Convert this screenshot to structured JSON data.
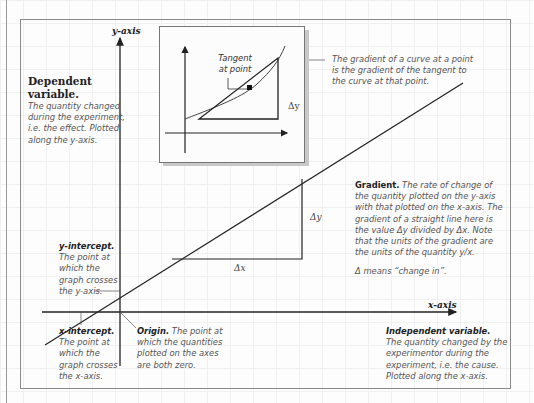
{
  "axes": {
    "y_label": "y-axis",
    "x_label": "x-axis"
  },
  "dependent_variable": {
    "title": "Dependent variable.",
    "lines": [
      "The quantity changed",
      "during the experiment,",
      "i.e. the effect. Plotted",
      "along the y-axis."
    ]
  },
  "inset": {
    "tangent_label_lines": [
      "Tangent",
      "at point"
    ],
    "delta_y": "Δy",
    "caption_lines": [
      "The gradient of a curve at a point",
      "is the gradient of the tangent to",
      "the curve at that point."
    ]
  },
  "gradient": {
    "title": "Gradient.",
    "first_line_rest": " The rate of change of",
    "lines": [
      "the quantity plotted on the y-axis",
      "with that plotted on the x-axis. The",
      "gradient of a straight line here is",
      "the value Δy divided by Δx. Note",
      "that the units of the gradient are",
      "the units of the quantity y/x."
    ],
    "note": "Δ means “change in”.",
    "delta_x": "Δx",
    "delta_y": "Δy"
  },
  "y_intercept": {
    "title": "y-intercept.",
    "lines": [
      "The point at",
      "which the",
      "graph crosses",
      "the y-axis."
    ]
  },
  "x_intercept": {
    "title": "x-intercept.",
    "lines": [
      "The point at",
      "which the",
      "graph crosses",
      "the x-axis."
    ]
  },
  "origin": {
    "title": "Origin.",
    "first_line_rest": " The point at",
    "lines": [
      "which the quantities",
      "plotted on the axes",
      "are both zero."
    ]
  },
  "independent_variable": {
    "title": "Independent variable.",
    "lines": [
      "The quantity changed by the",
      "experimentor during the",
      "experiment, i.e. the cause.",
      "Plotted along the x-axis."
    ]
  },
  "colors": {
    "line": "#222222",
    "frame": "#8a8a8a",
    "body_text": "#555555",
    "heading_text": "#222222"
  }
}
